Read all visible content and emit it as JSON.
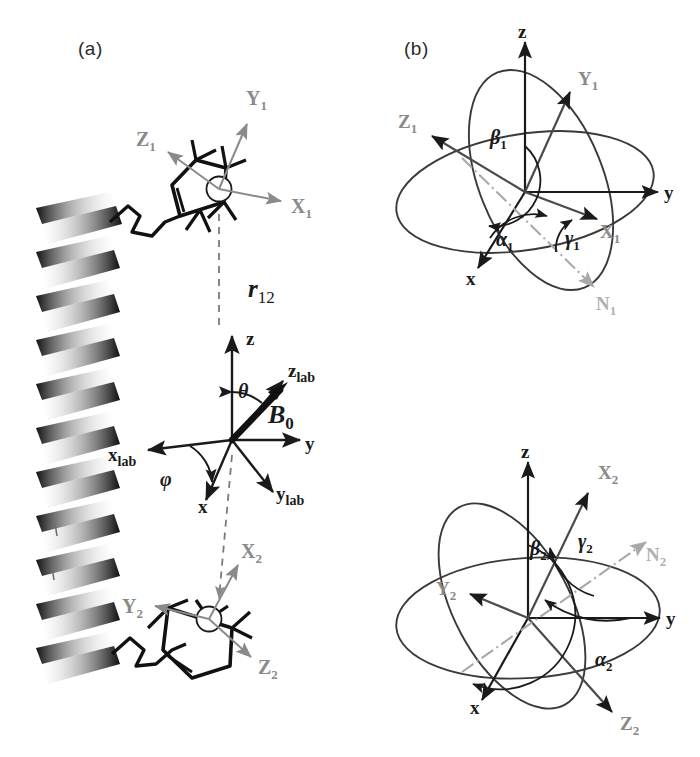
{
  "figure": {
    "background": "#ffffff",
    "width": 700,
    "height": 757
  },
  "colors": {
    "ink_black": "#1a1a1a",
    "axis_dark": "#2b2b2b",
    "molecular_axis_gray": "#8a8a8a",
    "node_line_gray": "#9b9b9b",
    "ellipse_stroke": "#3a3a3a",
    "dashed_connector": "#7a7a7a",
    "helix_ribbon": "#111111"
  },
  "panels": [
    {
      "id": "a",
      "label": "(a)",
      "x": 78,
      "y": 38
    },
    {
      "id": "b",
      "label": "(b)",
      "x": 404,
      "y": 38
    }
  ],
  "panel_a": {
    "connector": {
      "name": "r12",
      "label": "r",
      "subscript": "12",
      "style": "dashed",
      "x": 200,
      "y": 140,
      "x2": 260,
      "y2": 620
    },
    "upper_nitroxide": {
      "name": "nitroxide-label-1",
      "origin": {
        "x": 219,
        "y": 189
      },
      "axes": [
        {
          "name": "X1",
          "label": "X",
          "subscript": "1",
          "label_x": 291,
          "label_y": 207,
          "tip_x": 278,
          "tip_y": 199,
          "color": "#8a8a8a"
        },
        {
          "name": "Y1",
          "label": "Y",
          "subscript": "1",
          "label_x": 249,
          "label_y": 98,
          "tip_x": 244,
          "tip_y": 121,
          "color": "#8a8a8a"
        },
        {
          "name": "Z1",
          "label": "Z",
          "subscript": "1",
          "label_x": 144,
          "label_y": 139,
          "tip_x": 166,
          "tip_y": 150,
          "color": "#8a8a8a"
        }
      ]
    },
    "lower_nitroxide": {
      "name": "nitroxide-label-2",
      "origin": {
        "x": 209,
        "y": 619
      },
      "axes": [
        {
          "name": "X2",
          "label": "X",
          "subscript": "2",
          "label_x": 243,
          "label_y": 551,
          "tip_x": 235,
          "tip_y": 568,
          "color": "#8a8a8a"
        },
        {
          "name": "Y2",
          "label": "Y",
          "subscript": "2",
          "label_x": 131,
          "label_y": 606,
          "tip_x": 158,
          "tip_y": 608,
          "color": "#8a8a8a"
        },
        {
          "name": "Z2",
          "label": "Z",
          "subscript": "2",
          "label_x": 260,
          "label_y": 667,
          "tip_x": 248,
          "tip_y": 655,
          "color": "#8a8a8a"
        }
      ]
    },
    "lab_frame": {
      "name": "lab-frame",
      "origin": {
        "x": 232,
        "y": 440
      },
      "field_vector": {
        "name": "B0",
        "label": "B",
        "subscript": "0",
        "label_x": 272,
        "label_y": 412,
        "tip_x": 286,
        "tip_y": 385
      },
      "angles": [
        {
          "name": "theta",
          "label": "θ",
          "x": 246,
          "y": 392
        },
        {
          "name": "phi",
          "label": "φ",
          "x": 165,
          "y": 478
        }
      ],
      "axes": [
        {
          "name": "z",
          "label": "z",
          "label_x": 239,
          "label_y": 338,
          "color": "#1a1a1a"
        },
        {
          "name": "y",
          "label": "y",
          "label_x": 305,
          "label_y": 447,
          "color": "#1a1a1a"
        },
        {
          "name": "x",
          "label": "x",
          "label_x": 196,
          "label_y": 505,
          "color": "#1a1a1a"
        },
        {
          "name": "z-lab",
          "label": "z",
          "subscript": "lab",
          "label_x": 291,
          "label_y": 375,
          "color": "#1a1a1a"
        },
        {
          "name": "y-lab",
          "label": "y",
          "subscript": "lab",
          "label_x": 278,
          "label_y": 494,
          "color": "#1a1a1a"
        },
        {
          "name": "x-lab",
          "label": "x",
          "subscript": "lab",
          "label_x": 118,
          "label_y": 456,
          "color": "#1a1a1a"
        }
      ]
    },
    "dna_helix": {
      "name": "dna-duplex-ribbon",
      "turns": 11,
      "x": 30,
      "y": 190,
      "width": 100,
      "height": 500
    }
  },
  "panel_b_top": {
    "name": "euler-frame-1",
    "origin": {
      "x": 525,
      "y": 192
    },
    "axes": [
      {
        "name": "z",
        "label": "z",
        "subscript": "",
        "label_x": 519,
        "label_y": 36,
        "color": "#1a1a1a"
      },
      {
        "name": "y",
        "label": "y",
        "subscript": "",
        "label_x": 665,
        "label_y": 200,
        "color": "#1a1a1a"
      },
      {
        "name": "x",
        "label": "x",
        "subscript": "",
        "label_x": 465,
        "label_y": 277,
        "color": "#1a1a1a"
      },
      {
        "name": "X1",
        "label": "X",
        "subscript": "1",
        "label_x": 603,
        "label_y": 232,
        "color": "#8a8a8a"
      },
      {
        "name": "Y1",
        "label": "Y",
        "subscript": "1",
        "label_x": 583,
        "label_y": 78,
        "color": "#8a8a8a"
      },
      {
        "name": "Z1",
        "label": "Z",
        "subscript": "1",
        "label_x": 404,
        "label_y": 121,
        "color": "#8a8a8a"
      },
      {
        "name": "N1",
        "label": "N",
        "subscript": "1",
        "label_x": 600,
        "label_y": 303,
        "color": "#a0a0a0"
      }
    ],
    "angles": [
      {
        "name": "alpha1",
        "label": "α",
        "subscript": "1",
        "x": 503,
        "y": 238
      },
      {
        "name": "beta1",
        "label": "β",
        "subscript": "1",
        "x": 497,
        "y": 136
      },
      {
        "name": "gamma1",
        "label": "γ",
        "subscript": "1",
        "x": 570,
        "y": 238
      }
    ]
  },
  "panel_b_bottom": {
    "name": "euler-frame-2",
    "origin": {
      "x": 528,
      "y": 618
    },
    "axes": [
      {
        "name": "z",
        "label": "z",
        "subscript": "",
        "label_x": 523,
        "label_y": 456,
        "color": "#1a1a1a"
      },
      {
        "name": "y",
        "label": "y",
        "subscript": "",
        "label_x": 668,
        "label_y": 620,
        "color": "#1a1a1a"
      },
      {
        "name": "x",
        "label": "x",
        "subscript": "",
        "label_x": 470,
        "label_y": 706,
        "color": "#1a1a1a"
      },
      {
        "name": "X2",
        "label": "X",
        "subscript": "2",
        "label_x": 602,
        "label_y": 472,
        "color": "#8a8a8a"
      },
      {
        "name": "Y2",
        "label": "Y",
        "subscript": "2",
        "label_x": 443,
        "label_y": 588,
        "color": "#8a8a8a"
      },
      {
        "name": "Z2",
        "label": "Z",
        "subscript": "2",
        "label_x": 623,
        "label_y": 723,
        "color": "#8a8a8a"
      },
      {
        "name": "N2",
        "label": "N",
        "subscript": "2",
        "label_x": 650,
        "label_y": 554,
        "color": "#a0a0a0"
      }
    ],
    "angles": [
      {
        "name": "alpha2",
        "label": "α",
        "subscript": "2",
        "x": 600,
        "y": 658
      },
      {
        "name": "beta2",
        "label": "β",
        "subscript": "2",
        "x": 537,
        "y": 547
      },
      {
        "name": "gamma2",
        "label": "γ",
        "subscript": "2",
        "x": 584,
        "y": 540
      }
    ]
  }
}
